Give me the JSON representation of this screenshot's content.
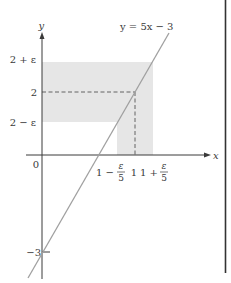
{
  "diagram": {
    "type": "function-graph-epsilon-delta",
    "equation_label": "y = 5x − 3",
    "axes": {
      "x_label": "x",
      "y_label": "y",
      "origin_label": "0"
    },
    "y_ticks": {
      "upper": "2 + ε",
      "center": "2",
      "lower": "2 − ε",
      "intercept": "−3"
    },
    "x_ticks": {
      "lower_prefix": "1 −",
      "center": "1",
      "upper_prefix": "1 +",
      "frac_num": "ε",
      "frac_den": "5"
    },
    "colors": {
      "band": "#e6e6e6",
      "line": "#9a9a9a",
      "axis": "#3a3a3a",
      "dash": "#555555",
      "border": "#333333"
    }
  }
}
